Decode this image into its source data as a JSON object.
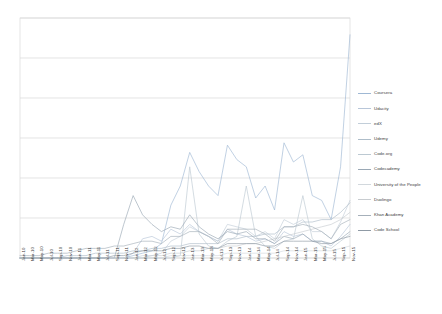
{
  "chart_data": {
    "type": "line",
    "title": "",
    "subtitle": "",
    "xlabel": "",
    "ylabel": "",
    "grid": true,
    "legend_position": "right",
    "ylim": [
      0,
      100
    ],
    "yticks_visible": false,
    "gridline_count": 6,
    "x": [
      "Jan-10",
      "Mar-10",
      "May-10",
      "Jul-10",
      "Sep-10",
      "Nov-10",
      "Jan-11",
      "Mar-11",
      "May-11",
      "Jul-11",
      "Sep-11",
      "Nov-11",
      "Jan-12",
      "Mar-12",
      "May-12",
      "Jul-12",
      "Sep-12",
      "Nov-12",
      "Jan-13",
      "Mar-13",
      "May-13",
      "Jul-13",
      "Sep-13",
      "Nov-13",
      "Jan-14",
      "Mar-14",
      "May-14",
      "Jul-14",
      "Sep-14",
      "Nov-14",
      "Jan-15",
      "Mar-15",
      "May-15",
      "Jul-15",
      "Sep-15",
      "Nov-15"
    ],
    "series": [
      {
        "name": "Coursera",
        "color": "#9fb8d4",
        "values": [
          0,
          0,
          0,
          0,
          0,
          0,
          0,
          0,
          0,
          0,
          0,
          0,
          1,
          2,
          3,
          6,
          22,
          30,
          44,
          36,
          30,
          26,
          47,
          41,
          38,
          25,
          30,
          20,
          48,
          40,
          43,
          26,
          24,
          16,
          38,
          93
        ]
      },
      {
        "name": "Udacity",
        "color": "#b8c6d9",
        "values": [
          0,
          0,
          0,
          0,
          0,
          0,
          0,
          0,
          0,
          0,
          0,
          0,
          2,
          8,
          9,
          7,
          12,
          10,
          14,
          11,
          9,
          7,
          12,
          10,
          9,
          7,
          8,
          6,
          11,
          9,
          10,
          7,
          7,
          5,
          9,
          14
        ]
      },
      {
        "name": "edX",
        "color": "#c2ced9",
        "values": [
          0,
          0,
          0,
          0,
          0,
          0,
          0,
          0,
          0,
          0,
          0,
          0,
          0,
          1,
          1,
          2,
          7,
          9,
          13,
          11,
          9,
          7,
          14,
          13,
          12,
          9,
          11,
          8,
          16,
          14,
          16,
          11,
          11,
          8,
          15,
          24
        ]
      },
      {
        "name": "Udemy",
        "color": "#aebdc9",
        "values": [
          0,
          0,
          0,
          0,
          0,
          1,
          1,
          1,
          2,
          2,
          2,
          2,
          3,
          3,
          4,
          4,
          5,
          5,
          6,
          6,
          6,
          6,
          8,
          8,
          9,
          9,
          10,
          10,
          13,
          13,
          15,
          15,
          16,
          16,
          19,
          23
        ]
      },
      {
        "name": "Code.org",
        "color": "#bcc9d2",
        "values": [
          0,
          0,
          0,
          0,
          0,
          0,
          0,
          0,
          0,
          0,
          0,
          0,
          0,
          0,
          0,
          0,
          0,
          1,
          38,
          10,
          5,
          4,
          7,
          9,
          30,
          9,
          5,
          4,
          7,
          8,
          26,
          8,
          5,
          4,
          7,
          10
        ]
      },
      {
        "name": "Codecademy",
        "color": "#9aa8b5",
        "values": [
          0,
          0,
          0,
          0,
          0,
          0,
          0,
          0,
          0,
          0,
          0,
          14,
          26,
          18,
          14,
          11,
          13,
          12,
          18,
          13,
          10,
          8,
          11,
          10,
          11,
          8,
          8,
          6,
          9,
          8,
          10,
          7,
          7,
          6,
          8,
          11
        ]
      },
      {
        "name": "University of the People",
        "color": "#d2d8dd",
        "values": [
          0,
          0,
          0,
          0,
          0,
          0,
          0,
          0,
          0,
          0,
          0,
          0,
          0,
          0,
          0,
          0,
          1,
          1,
          1,
          1,
          1,
          1,
          2,
          2,
          2,
          2,
          2,
          2,
          3,
          3,
          3,
          3,
          3,
          3,
          4,
          5
        ]
      },
      {
        "name": "Duolingo",
        "color": "#c8ccd0",
        "values": [
          0,
          0,
          0,
          0,
          0,
          0,
          0,
          0,
          0,
          0,
          0,
          0,
          0,
          0,
          1,
          1,
          2,
          2,
          3,
          3,
          4,
          4,
          5,
          5,
          6,
          6,
          7,
          8,
          9,
          10,
          11,
          12,
          13,
          14,
          16,
          19
        ]
      },
      {
        "name": "Khan Academy",
        "color": "#a6b0ba",
        "values": [
          1,
          1,
          1,
          2,
          2,
          2,
          3,
          4,
          4,
          4,
          5,
          5,
          6,
          7,
          7,
          6,
          9,
          9,
          11,
          11,
          9,
          6,
          12,
          12,
          12,
          12,
          10,
          7,
          13,
          13,
          14,
          13,
          11,
          8,
          14,
          16
        ]
      },
      {
        "name": "Code School",
        "color": "#8f9aa5",
        "values": [
          0,
          0,
          0,
          0,
          0,
          0,
          0,
          0,
          0,
          0,
          1,
          1,
          2,
          3,
          3,
          3,
          4,
          4,
          5,
          5,
          4,
          4,
          6,
          6,
          6,
          6,
          5,
          5,
          7,
          7,
          7,
          7,
          6,
          6,
          8,
          9
        ]
      }
    ]
  },
  "axes": {
    "plot_left": 20,
    "plot_right": 350,
    "plot_top": 18,
    "plot_bottom": 258,
    "border_color": "#d9d9d9",
    "gridline_color": "#d9d9d9"
  }
}
